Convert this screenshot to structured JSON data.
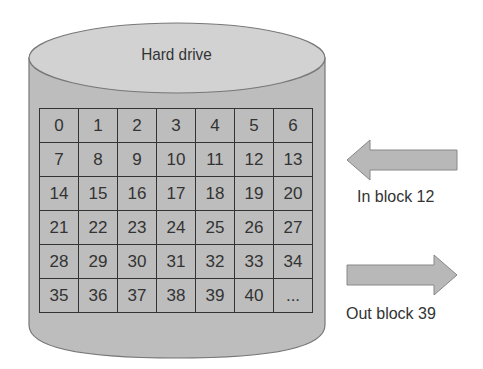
{
  "drive": {
    "title": "Hard drive",
    "rows": [
      [
        "0",
        "1",
        "2",
        "3",
        "4",
        "5",
        "6"
      ],
      [
        "7",
        "8",
        "9",
        "10",
        "11",
        "12",
        "13"
      ],
      [
        "14",
        "15",
        "16",
        "17",
        "18",
        "19",
        "20"
      ],
      [
        "21",
        "22",
        "23",
        "24",
        "25",
        "26",
        "27"
      ],
      [
        "28",
        "29",
        "30",
        "31",
        "32",
        "33",
        "34"
      ],
      [
        "35",
        "36",
        "37",
        "38",
        "39",
        "40",
        "..."
      ]
    ]
  },
  "arrows": {
    "in_label": "In block 12",
    "out_label": "Out block 39"
  },
  "colors": {
    "cylinder_fill": "#bdbdbd",
    "top_fill": "#d2d2d2",
    "arrow_fill": "#b8b8b8",
    "stroke": "#555555"
  }
}
